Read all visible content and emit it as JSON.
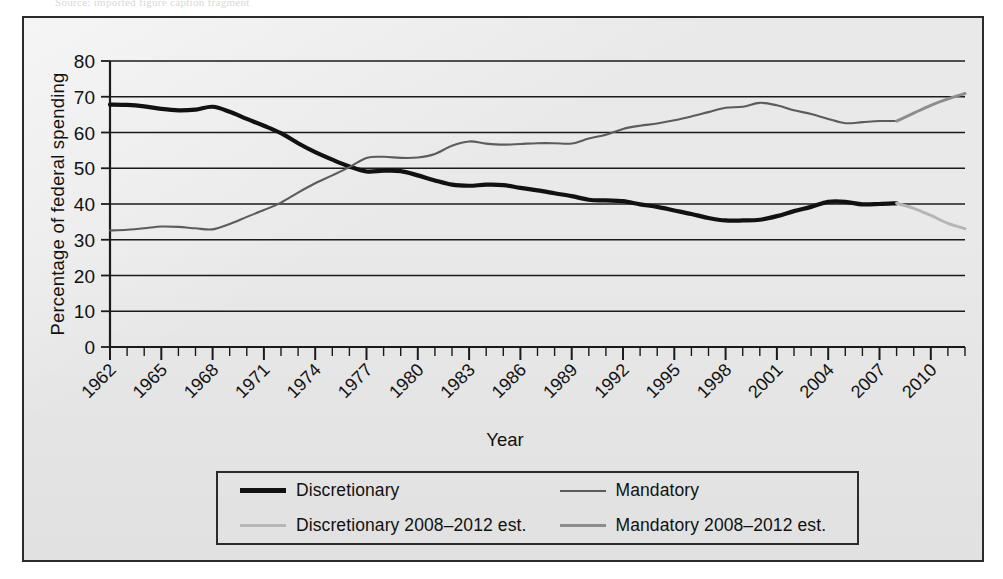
{
  "figure": {
    "top_sliver_text": "Source: imported figure caption fragment",
    "background_color": "#e9e9e9",
    "frame_color": "#2b2b2b"
  },
  "chart_data": {
    "type": "line",
    "title": "",
    "xlabel": "Year",
    "ylabel": "Percentage of federal spending",
    "xlim": [
      1962,
      2012
    ],
    "ylim": [
      0,
      80
    ],
    "yticks": [
      0,
      10,
      20,
      30,
      40,
      50,
      60,
      70,
      80
    ],
    "xticks": [
      1962,
      1965,
      1968,
      1971,
      1974,
      1977,
      1980,
      1983,
      1986,
      1989,
      1992,
      1995,
      1998,
      2001,
      2004,
      2007,
      2010
    ],
    "xtick_labels": [
      "1962",
      "1965",
      "1968",
      "1971",
      "1974",
      "1977",
      "1980",
      "1983",
      "1986",
      "1989",
      "1992",
      "1995",
      "1998",
      "2001",
      "2004",
      "2007",
      "2010"
    ],
    "minor_xtick_step": 1,
    "grid": "horizontal",
    "legend_position": "below-center",
    "x": [
      1962,
      1963,
      1964,
      1965,
      1966,
      1967,
      1968,
      1969,
      1970,
      1971,
      1972,
      1973,
      1974,
      1975,
      1976,
      1977,
      1978,
      1979,
      1980,
      1981,
      1982,
      1983,
      1984,
      1985,
      1986,
      1987,
      1988,
      1989,
      1990,
      1991,
      1992,
      1993,
      1994,
      1995,
      1996,
      1997,
      1998,
      1999,
      2000,
      2001,
      2002,
      2003,
      2004,
      2005,
      2006,
      2007,
      2008,
      2009,
      2010,
      2011,
      2012
    ],
    "series": [
      {
        "name": "Discretionary",
        "color": "#111111",
        "width": 4.2,
        "x": [
          1962,
          1963,
          1964,
          1965,
          1966,
          1967,
          1968,
          1969,
          1970,
          1971,
          1972,
          1973,
          1974,
          1975,
          1976,
          1977,
          1978,
          1979,
          1980,
          1981,
          1982,
          1983,
          1984,
          1985,
          1986,
          1987,
          1988,
          1989,
          1990,
          1991,
          1992,
          1993,
          1994,
          1995,
          1996,
          1997,
          1998,
          1999,
          2000,
          2001,
          2002,
          2003,
          2004,
          2005,
          2006,
          2007,
          2008
        ],
        "values": [
          67.8,
          67.7,
          67.3,
          66.6,
          66.2,
          66.4,
          67.2,
          65.8,
          63.8,
          61.9,
          59.8,
          57.0,
          54.5,
          52.4,
          50.5,
          49.1,
          49.3,
          49.2,
          48.0,
          46.6,
          45.4,
          45.1,
          45.4,
          45.3,
          44.5,
          43.8,
          43.0,
          42.2,
          41.2,
          41.0,
          40.8,
          39.9,
          39.2,
          38.2,
          37.2,
          36.1,
          35.4,
          35.4,
          35.6,
          36.6,
          38.0,
          39.2,
          40.6,
          40.6,
          39.9,
          40.0,
          40.2
        ]
      },
      {
        "name": "Mandatory",
        "color": "#5c5c5c",
        "width": 2.1,
        "x": [
          1962,
          1963,
          1964,
          1965,
          1966,
          1967,
          1968,
          1969,
          1970,
          1971,
          1972,
          1973,
          1974,
          1975,
          1976,
          1977,
          1978,
          1979,
          1980,
          1981,
          1982,
          1983,
          1984,
          1985,
          1986,
          1987,
          1988,
          1989,
          1990,
          1991,
          1992,
          1993,
          1994,
          1995,
          1996,
          1997,
          1998,
          1999,
          2000,
          2001,
          2002,
          2003,
          2004,
          2005,
          2006,
          2007,
          2008
        ],
        "values": [
          32.6,
          32.8,
          33.2,
          33.7,
          33.6,
          33.2,
          32.9,
          34.4,
          36.4,
          38.3,
          40.4,
          43.2,
          45.8,
          48.0,
          50.3,
          52.9,
          53.2,
          52.9,
          53.0,
          54.0,
          56.3,
          57.5,
          56.9,
          56.6,
          56.8,
          57.0,
          57.0,
          56.9,
          58.3,
          59.4,
          61.0,
          61.9,
          62.5,
          63.4,
          64.5,
          65.7,
          66.9,
          67.2,
          68.3,
          67.6,
          66.2,
          65.2,
          63.8,
          62.6,
          62.9,
          63.2,
          63.2
        ]
      },
      {
        "name": "Discretionary 2008–2012 est.",
        "color": "#b6b6b6",
        "width": 3.0,
        "x": [
          2008,
          2009,
          2010,
          2011,
          2012
        ],
        "values": [
          40.2,
          38.8,
          36.8,
          34.6,
          33.1
        ]
      },
      {
        "name": "Mandatory 2008–2012 est.",
        "color": "#8d8d8d",
        "width": 3.0,
        "x": [
          2008,
          2009,
          2010,
          2011,
          2012
        ],
        "values": [
          63.2,
          65.4,
          67.6,
          69.4,
          70.9
        ]
      }
    ]
  },
  "legend": {
    "items": [
      {
        "label": "Discretionary",
        "swatch": "sw-disc"
      },
      {
        "label": "Mandatory",
        "swatch": "sw-mand"
      },
      {
        "label": "Discretionary 2008–2012 est.",
        "swatch": "sw-disc-est"
      },
      {
        "label": "Mandatory 2008–2012 est.",
        "swatch": "sw-mand-est"
      }
    ]
  }
}
